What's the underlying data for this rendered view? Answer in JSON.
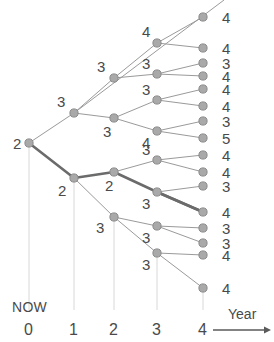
{
  "figure": {
    "name": "scenario-tree",
    "type": "tree-diagram",
    "width": 274,
    "height": 342,
    "background": "#ffffff",
    "node_fill": "#a9a9a9",
    "node_stroke": "#8a8a8a",
    "edge_color": "#9a9a9a",
    "highlight_edge_color": "#6b6b6b",
    "text_color": "#4a4a4a",
    "tick_line_color": "#d8d8d8"
  },
  "axis": {
    "title": "Year",
    "now_label": "NOW",
    "ticks": [
      {
        "label": "0",
        "x": 29
      },
      {
        "label": "1",
        "x": 74
      },
      {
        "label": "2",
        "x": 114
      },
      {
        "label": "3",
        "x": 157
      },
      {
        "label": "4",
        "x": 203
      }
    ],
    "arrow": {
      "x1": 213,
      "x2": 271,
      "y": 330
    },
    "tick_label_y": 322,
    "now_x": 12,
    "now_y": 300,
    "title_x": 228,
    "title_y": 307
  },
  "chart_data": {
    "type": "tree",
    "title": "",
    "xlabel": "Year",
    "stages": [
      0,
      1,
      2,
      3,
      4
    ],
    "stage_x": [
      29,
      74,
      114,
      157,
      203
    ],
    "root_value": 2,
    "nodes": [
      {
        "id": "n0",
        "stage": 0,
        "x": 29,
        "y": 143,
        "value": "2",
        "label_dx": -16,
        "label_dy": -7
      },
      {
        "id": "n1a",
        "stage": 1,
        "x": 74,
        "y": 113,
        "value": "3",
        "label_dx": -17,
        "label_dy": -19
      },
      {
        "id": "n1b",
        "stage": 1,
        "x": 74,
        "y": 178,
        "value": "2",
        "label_dx": -16,
        "label_dy": 5
      },
      {
        "id": "n2a",
        "stage": 2,
        "x": 114,
        "y": 78,
        "value": "3",
        "label_dx": -17,
        "label_dy": -19
      },
      {
        "id": "n2b",
        "stage": 2,
        "x": 114,
        "y": 118,
        "value": "3",
        "label_dx": -11,
        "label_dy": 6
      },
      {
        "id": "n2c",
        "stage": 2,
        "x": 114,
        "y": 172,
        "value": "2",
        "label_dx": -9,
        "label_dy": 6
      },
      {
        "id": "n2d",
        "stage": 2,
        "x": 114,
        "y": 217,
        "value": "3",
        "label_dx": -18,
        "label_dy": 3
      },
      {
        "id": "n3a",
        "stage": 3,
        "x": 157,
        "y": 43,
        "value": "4",
        "label_dx": -15,
        "label_dy": -19
      },
      {
        "id": "n3b",
        "stage": 3,
        "x": 157,
        "y": 74,
        "value": "3",
        "label_dx": -15,
        "label_dy": -18
      },
      {
        "id": "n3c",
        "stage": 3,
        "x": 157,
        "y": 100,
        "value": "3",
        "label_dx": -15,
        "label_dy": -18
      },
      {
        "id": "n3d",
        "stage": 3,
        "x": 157,
        "y": 131,
        "value": "4",
        "label_dx": -15,
        "label_dy": 4
      },
      {
        "id": "n3e",
        "stage": 3,
        "x": 157,
        "y": 160,
        "value": "3",
        "label_dx": -15,
        "label_dy": -18
      },
      {
        "id": "n3f",
        "stage": 3,
        "x": 157,
        "y": 192,
        "value": "3",
        "label_dx": -15,
        "label_dy": 4
      },
      {
        "id": "n3g",
        "stage": 3,
        "x": 157,
        "y": 226,
        "value": "3",
        "label_dx": -15,
        "label_dy": 4
      },
      {
        "id": "n3h",
        "stage": 3,
        "x": 157,
        "y": 253,
        "value": "3",
        "label_dx": -15,
        "label_dy": 4
      }
    ],
    "leaves": [
      {
        "id": "L1",
        "x": 203,
        "y": 17,
        "value": "4",
        "parent": "n3a"
      },
      {
        "id": "L2",
        "x": 203,
        "y": 48,
        "value": "4",
        "parent": "n3a"
      },
      {
        "id": "L3",
        "x": 203,
        "y": 63,
        "value": "3",
        "parent": "n3b"
      },
      {
        "id": "L4",
        "x": 203,
        "y": 76,
        "value": "4",
        "parent": "n3b"
      },
      {
        "id": "L5",
        "x": 203,
        "y": 89,
        "value": "4",
        "parent": "n3c"
      },
      {
        "id": "L6",
        "x": 203,
        "y": 106,
        "value": "4",
        "parent": "n3c"
      },
      {
        "id": "L7",
        "x": 203,
        "y": 121,
        "value": "3",
        "parent": "n3d"
      },
      {
        "id": "L8",
        "x": 203,
        "y": 138,
        "value": "5",
        "parent": "n3d"
      },
      {
        "id": "L9",
        "x": 203,
        "y": 155,
        "value": "4",
        "parent": "n3e"
      },
      {
        "id": "L10",
        "x": 203,
        "y": 172,
        "value": "4",
        "parent": "n3e"
      },
      {
        "id": "L11",
        "x": 203,
        "y": 186,
        "value": "3",
        "parent": "n3f"
      },
      {
        "id": "L12",
        "x": 203,
        "y": 212,
        "value": "4",
        "parent": "n3f"
      },
      {
        "id": "L13",
        "x": 203,
        "y": 228,
        "value": "3",
        "parent": "n3g"
      },
      {
        "id": "L14",
        "x": 203,
        "y": 243,
        "value": "3",
        "parent": "n3g"
      },
      {
        "id": "L15",
        "x": 203,
        "y": 255,
        "value": "4",
        "parent": "n3h"
      },
      {
        "id": "L16",
        "x": 203,
        "y": 288,
        "value": "4",
        "parent": "n3h"
      }
    ],
    "edges": [
      {
        "from": "n0",
        "to": "n1a",
        "highlight": false
      },
      {
        "from": "n0",
        "to": "n1b",
        "highlight": true
      },
      {
        "from": "n1a",
        "to": "n2a",
        "highlight": false
      },
      {
        "from": "n1a",
        "to": "n2b",
        "highlight": false
      },
      {
        "from": "n1b",
        "to": "n2c",
        "highlight": true
      },
      {
        "from": "n1b",
        "to": "n2d",
        "highlight": false
      },
      {
        "from": "n2a",
        "to": "n3a",
        "highlight": false
      },
      {
        "from": "n2a",
        "to": "n3b",
        "highlight": false
      },
      {
        "from": "n2b",
        "to": "n3c",
        "highlight": false
      },
      {
        "from": "n2b",
        "to": "n3d",
        "highlight": false
      },
      {
        "from": "n2c",
        "to": "n3e",
        "highlight": false
      },
      {
        "from": "n2c",
        "to": "n3f",
        "highlight": true
      },
      {
        "from": "n2d",
        "to": "n3g",
        "highlight": false
      },
      {
        "from": "n2d",
        "to": "n3h",
        "highlight": false
      },
      {
        "from": "n3f",
        "to": "L12",
        "highlight": true
      }
    ],
    "top_diagonal": {
      "x1": 74,
      "y1": 113,
      "x2": 224,
      "y2": 0
    },
    "leaf_label_x": 222
  }
}
